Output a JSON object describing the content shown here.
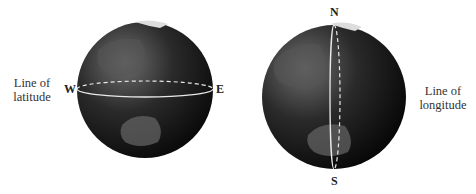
{
  "figure": {
    "left_globe": {
      "caption_line1": "Line of",
      "caption_line2": "latitude",
      "west": "W",
      "east": "E"
    },
    "right_globe": {
      "caption_line1": "Line of",
      "caption_line2": "longitude",
      "north": "N",
      "south": "S"
    },
    "colors": {
      "globe_dark": "#0a0a0a",
      "globe_light": "#7a7a7a",
      "line": "#e8e8e8"
    }
  }
}
